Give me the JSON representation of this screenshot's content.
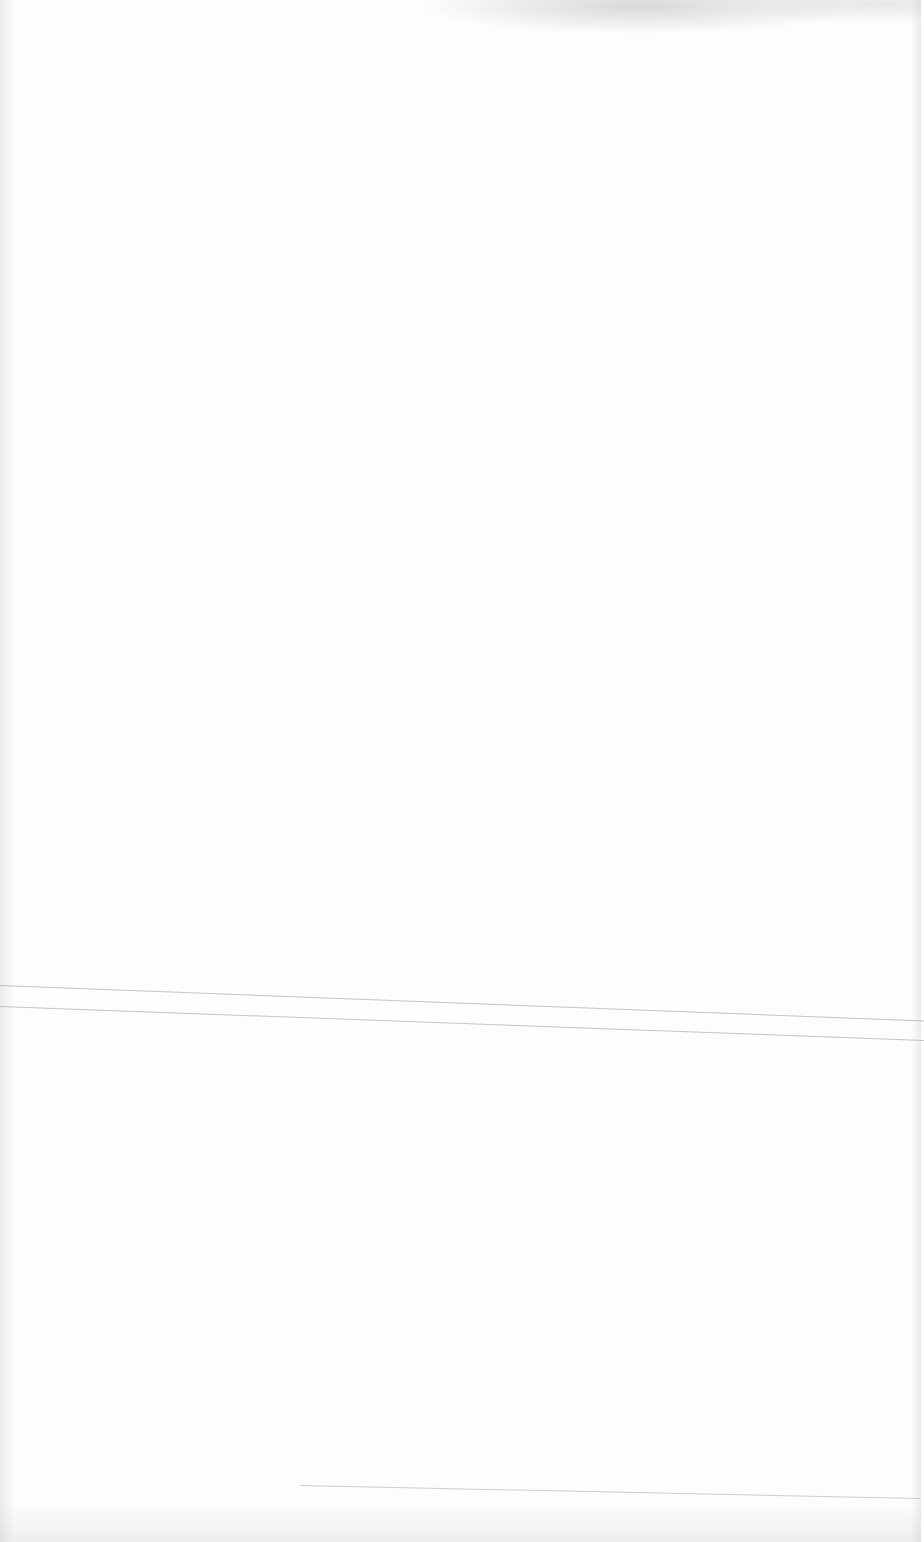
{
  "document": {
    "type": "blank scanned page",
    "text": "",
    "background_color": "#fdfdfd",
    "artifacts": [
      "fold-line",
      "fold-line",
      "fold-line",
      "top-smudge",
      "edge-shading"
    ]
  }
}
